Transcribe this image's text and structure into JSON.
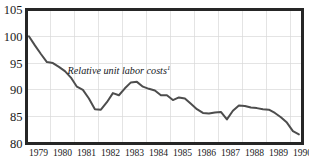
{
  "chart_data": {
    "type": "line",
    "title": "",
    "subtitle": "",
    "xlabel": "",
    "ylabel": "",
    "xlim": [
      1978.5,
      1990.0
    ],
    "ylim": [
      80,
      105
    ],
    "grid": true,
    "legend_position": "inline-annotation",
    "annotations": [
      {
        "text": "Relative unit labor costs",
        "superscript": "1",
        "x": 1982.35,
        "y": 93.0
      }
    ],
    "y_ticks": [
      105,
      100,
      95,
      90,
      85,
      80
    ],
    "x_ticks": [
      1979,
      1980,
      1981,
      1982,
      1983,
      1984,
      1985,
      1986,
      1987,
      1988,
      1989,
      1990
    ],
    "series": [
      {
        "name": "Relative unit labor costs",
        "color": "#4d4d4d",
        "x": [
          1978.6,
          1978.85,
          1979.1,
          1979.35,
          1979.6,
          1979.85,
          1980.1,
          1980.35,
          1980.6,
          1980.85,
          1981.1,
          1981.35,
          1981.6,
          1981.85,
          1982.1,
          1982.35,
          1982.6,
          1982.85,
          1983.1,
          1983.35,
          1983.6,
          1983.85,
          1984.1,
          1984.35,
          1984.6,
          1984.85,
          1985.1,
          1985.35,
          1985.6,
          1985.85,
          1986.1,
          1986.35,
          1986.6,
          1986.85,
          1987.1,
          1987.35,
          1987.6,
          1987.85,
          1988.1,
          1988.35,
          1988.6,
          1988.85,
          1989.1,
          1989.35
        ],
        "y": [
          100.0,
          98.3,
          96.7,
          95.2,
          95.0,
          94.3,
          93.5,
          92.3,
          90.6,
          90.0,
          88.4,
          86.4,
          86.3,
          87.7,
          89.4,
          89.0,
          90.3,
          91.4,
          91.5,
          90.6,
          90.2,
          89.9,
          89.0,
          89.0,
          88.1,
          88.6,
          88.4,
          87.4,
          86.4,
          85.7,
          85.6,
          85.8,
          85.9,
          84.5,
          86.1,
          87.1,
          87.0,
          86.7,
          86.6,
          86.4,
          86.3,
          85.7,
          84.9,
          83.9
        ],
        "segments_description": "declines from 100 in late 1978 to a trough near 86.3 in early 1981, rebounds to a peak of 91.5 in early 1983, drifts down to 84.5 in late 1985, rebounds to 87.1 in 1986, then falls to 81.7 by mid-1989"
      }
    ],
    "extra_points": {
      "x": [
        1989.35,
        1989.6,
        1989.85
      ],
      "y": [
        83.9,
        82.3,
        81.7
      ]
    }
  },
  "axes": {
    "y_tick_labels": [
      "105",
      "100",
      "95",
      "90",
      "85",
      "80"
    ],
    "x_tick_labels": [
      "1979",
      "1980",
      "1981",
      "1982",
      "1983",
      "1984",
      "1985",
      "1986",
      "1987",
      "1988",
      "1989",
      "1990"
    ]
  },
  "colors": {
    "line": "#4d4d4d",
    "frame": "#262626",
    "grid": "#d9d9d9",
    "background": "#ffffff",
    "text": "#1a1a1a"
  }
}
